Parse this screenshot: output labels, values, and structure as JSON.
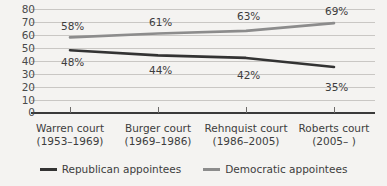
{
  "chart_data": {
    "type": "line",
    "title": "",
    "xlabel": "",
    "ylabel": "",
    "ylim": [
      0,
      80
    ],
    "ytick_step": 10,
    "grid": true,
    "legend_position": "bottom-center",
    "categories": [
      "Warren court",
      "Burger court",
      "Rehnquist court",
      "Roberts court"
    ],
    "category_years": [
      "(1953–1969)",
      "(1969–1986)",
      "(1986–2005)",
      "(2005–  )"
    ],
    "ytick_labels": [
      "80",
      "70",
      "60",
      "50",
      "40",
      "30",
      "20",
      "10",
      "0"
    ],
    "ytick_values": [
      80,
      70,
      60,
      50,
      40,
      30,
      20,
      10,
      0
    ],
    "series": [
      {
        "name": "Republican appointees",
        "color": "#333333",
        "values": [
          48,
          44,
          42,
          35
        ],
        "labels": [
          "48%",
          "44%",
          "42%",
          "35%"
        ]
      },
      {
        "name": "Democratic appointees",
        "color": "#8c8c8c",
        "values": [
          58,
          61,
          63,
          69
        ],
        "labels": [
          "58%",
          "61%",
          "63%",
          "69%"
        ]
      }
    ]
  },
  "legend": {
    "items": [
      {
        "label": "Republican appointees",
        "color": "#333333"
      },
      {
        "label": "Democratic appointees",
        "color": "#8c8c8c"
      }
    ]
  },
  "colors": {
    "background": "#f4f3f1",
    "gridline": "#c9c7c4",
    "axis": "#3a3a3a",
    "republican": "#333333",
    "democratic": "#8c8c8c",
    "text": "#3d3d3d"
  }
}
